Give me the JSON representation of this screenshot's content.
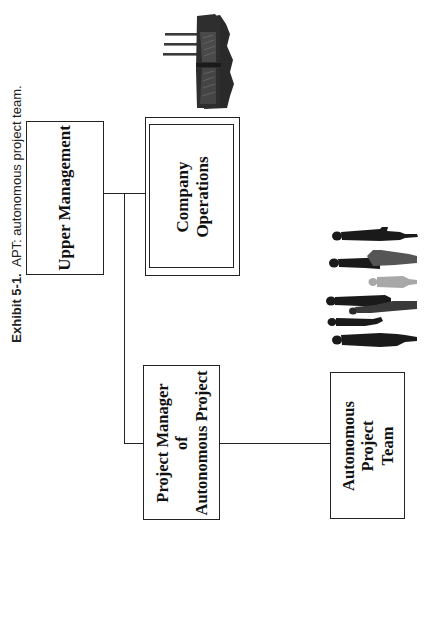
{
  "caption": {
    "label": "Exhibit 5-1.",
    "text": "APT: autonomous project team."
  },
  "nodes": {
    "upper_management": {
      "lines": [
        "Upper Management"
      ]
    },
    "company_operations": {
      "lines": [
        "Company",
        "Operations"
      ]
    },
    "project_manager": {
      "lines": [
        "Project Manager",
        "of",
        "Autonomous Project"
      ]
    },
    "autonomous_team": {
      "lines": [
        "Autonomous",
        "Project",
        "Team"
      ]
    }
  },
  "illustrations": {
    "factory": "factory-icon",
    "people": "people-group-icon"
  },
  "colors": {
    "line": "#222222",
    "silhouette_dark": "#1a1a1a",
    "silhouette_mid": "#555555",
    "silhouette_light": "#a8a8a8",
    "factory_body": "#2e2e2e",
    "factory_shade": "#4a4a4a"
  }
}
